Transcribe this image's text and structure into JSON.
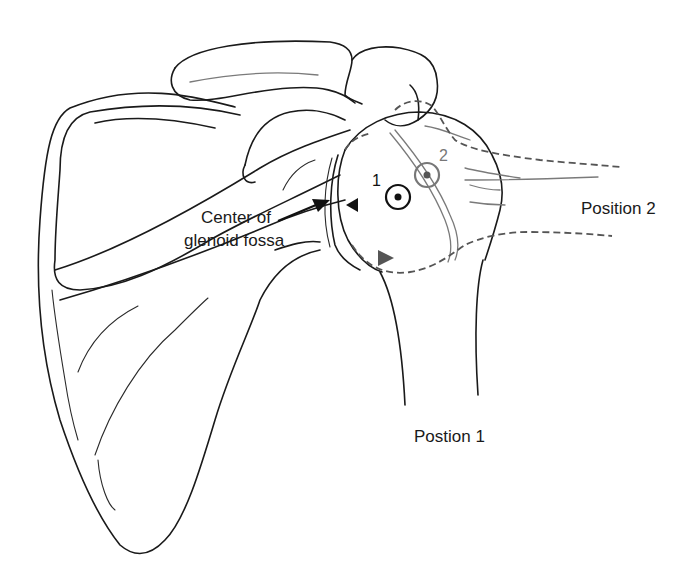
{
  "figure": {
    "labels": {
      "glenoid_line1": "Center of",
      "glenoid_line2": "glenoid fossa",
      "position_2": "Position 2",
      "position_1": "Postion 1",
      "marker_1": "1",
      "marker_2": "2"
    },
    "colors": {
      "outline": "#1a1a1a",
      "position_2_outline": "#555555",
      "position_2_marker": "#7a7a7a",
      "background": "#ffffff"
    },
    "markers": [
      {
        "id": "1",
        "description": "Center of humeral head, Position 1",
        "style": "black circle with dot"
      },
      {
        "id": "2",
        "description": "Center of humeral head, Position 2",
        "style": "gray circle with dot"
      }
    ]
  }
}
